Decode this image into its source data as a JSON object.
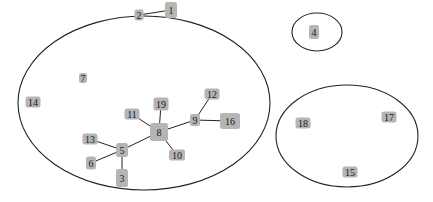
{
  "diagram": {
    "type": "network-graph",
    "colors": {
      "node_fill": "#b5b5b5",
      "edge": "#222222",
      "cluster_outline": "#222222",
      "background": "#ffffff"
    },
    "clusters": [
      {
        "id": "cluster-main",
        "cx": 144,
        "cy": 103,
        "rx": 126,
        "ry": 87,
        "members": [
          "1",
          "2",
          "3",
          "5",
          "6",
          "7",
          "8",
          "9",
          "10",
          "11",
          "12",
          "13",
          "14",
          "16",
          "19"
        ]
      },
      {
        "id": "cluster-4",
        "cx": 317,
        "cy": 32,
        "rx": 25,
        "ry": 19,
        "members": [
          "4"
        ]
      },
      {
        "id": "cluster-right",
        "cx": 347,
        "cy": 136,
        "rx": 71,
        "ry": 51,
        "members": [
          "15",
          "17",
          "18"
        ]
      }
    ],
    "nodes": [
      {
        "id": "1",
        "label": "1",
        "x": 171,
        "y": 10,
        "w": 12,
        "h": 16
      },
      {
        "id": "2",
        "label": "2",
        "x": 139,
        "y": 15,
        "w": 9,
        "h": 11
      },
      {
        "id": "3",
        "label": "3",
        "x": 122,
        "y": 178,
        "w": 12,
        "h": 18
      },
      {
        "id": "4",
        "label": "4",
        "x": 314,
        "y": 32,
        "w": 10,
        "h": 14
      },
      {
        "id": "5",
        "label": "5",
        "x": 122,
        "y": 150,
        "w": 12,
        "h": 14
      },
      {
        "id": "6",
        "label": "6",
        "x": 91,
        "y": 163,
        "w": 10,
        "h": 13
      },
      {
        "id": "7",
        "label": "7",
        "x": 83,
        "y": 78,
        "w": 8,
        "h": 10
      },
      {
        "id": "8",
        "label": "8",
        "x": 159,
        "y": 132,
        "w": 18,
        "h": 18
      },
      {
        "id": "9",
        "label": "9",
        "x": 195,
        "y": 120,
        "w": 10,
        "h": 12
      },
      {
        "id": "10",
        "label": "10",
        "x": 177,
        "y": 155,
        "w": 16,
        "h": 11
      },
      {
        "id": "11",
        "label": "11",
        "x": 132,
        "y": 114,
        "w": 15,
        "h": 11
      },
      {
        "id": "12",
        "label": "12",
        "x": 212,
        "y": 94,
        "w": 15,
        "h": 11
      },
      {
        "id": "13",
        "label": "13",
        "x": 90,
        "y": 139,
        "w": 15,
        "h": 11
      },
      {
        "id": "14",
        "label": "14",
        "x": 33,
        "y": 102,
        "w": 15,
        "h": 11
      },
      {
        "id": "15",
        "label": "15",
        "x": 350,
        "y": 172,
        "w": 15,
        "h": 11
      },
      {
        "id": "16",
        "label": "16",
        "x": 230,
        "y": 121,
        "w": 20,
        "h": 16
      },
      {
        "id": "17",
        "label": "17",
        "x": 389,
        "y": 117,
        "w": 15,
        "h": 11
      },
      {
        "id": "18",
        "label": "18",
        "x": 303,
        "y": 123,
        "w": 15,
        "h": 11
      },
      {
        "id": "19",
        "label": "19",
        "x": 161,
        "y": 104,
        "w": 15,
        "h": 13
      }
    ],
    "edges": [
      {
        "from": "2",
        "to": "1"
      },
      {
        "from": "8",
        "to": "11"
      },
      {
        "from": "8",
        "to": "19"
      },
      {
        "from": "8",
        "to": "9"
      },
      {
        "from": "8",
        "to": "10"
      },
      {
        "from": "8",
        "to": "5"
      },
      {
        "from": "9",
        "to": "12"
      },
      {
        "from": "9",
        "to": "16"
      },
      {
        "from": "5",
        "to": "13"
      },
      {
        "from": "5",
        "to": "6"
      },
      {
        "from": "5",
        "to": "3"
      }
    ]
  }
}
